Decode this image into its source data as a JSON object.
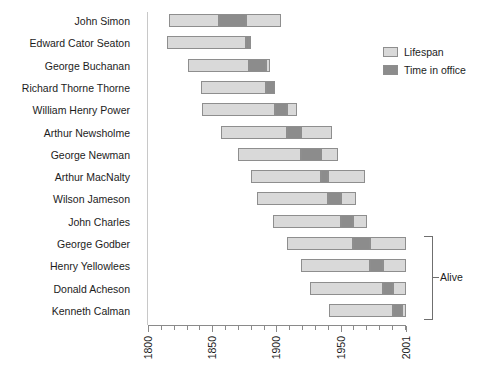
{
  "chart_data": {
    "type": "bar",
    "subtype": "horizontal-stacked-range",
    "title": "",
    "xlabel": "",
    "ylabel": "",
    "xlim": [
      1800,
      2001
    ],
    "grid": false,
    "legend_position": "top-right",
    "axis": {
      "tick_labels": [
        "1800",
        "1850",
        "1900",
        "1950",
        "2001"
      ],
      "tick_values": [
        1800,
        1850,
        1900,
        1950,
        2001
      ],
      "minor_tick_step": 10
    },
    "legend": [
      {
        "key": "lifespan",
        "label": "Lifespan",
        "color": "#d9d9d9"
      },
      {
        "key": "office",
        "label": "Time in office",
        "color": "#8c8c8c"
      }
    ],
    "annotations": [
      {
        "label": "Alive",
        "applies_to": [
          "George Godber",
          "Henry Yellowlees",
          "Donald Acheson",
          "Kenneth Calman"
        ]
      }
    ],
    "categories": [
      "John Simon",
      "Edward Cator Seaton",
      "George Buchanan",
      "Richard Thorne Thorne",
      "William Henry Power",
      "Arthur Newsholme",
      "George Newman",
      "Arthur MacNalty",
      "Wilson Jameson",
      "John Charles",
      "George Godber",
      "Henry Yellowlees",
      "Donald Acheson",
      "Kenneth Calman"
    ],
    "rows": [
      {
        "name": "John Simon",
        "born": 1816,
        "died": 1904,
        "office_start": 1855,
        "office_end": 1876,
        "alive": false
      },
      {
        "name": "Edward Cator Seaton",
        "born": 1815,
        "died": 1880,
        "office_start": 1876,
        "office_end": 1879,
        "alive": false
      },
      {
        "name": "George Buchanan",
        "born": 1831,
        "died": 1895,
        "office_start": 1879,
        "office_end": 1892,
        "alive": false
      },
      {
        "name": "Richard Thorne Thorne",
        "born": 1841,
        "died": 1899,
        "office_start": 1892,
        "office_end": 1899,
        "alive": false
      },
      {
        "name": "William Henry Power",
        "born": 1842,
        "died": 1916,
        "office_start": 1899,
        "office_end": 1908,
        "alive": false
      },
      {
        "name": "Arthur Newsholme",
        "born": 1857,
        "died": 1943,
        "office_start": 1908,
        "office_end": 1919,
        "alive": false
      },
      {
        "name": "George Newman",
        "born": 1870,
        "died": 1948,
        "office_start": 1919,
        "office_end": 1935,
        "alive": false
      },
      {
        "name": "Arthur MacNalty",
        "born": 1880,
        "died": 1969,
        "office_start": 1935,
        "office_end": 1940,
        "alive": false
      },
      {
        "name": "Wilson Jameson",
        "born": 1885,
        "died": 1962,
        "office_start": 1940,
        "office_end": 1950,
        "alive": false
      },
      {
        "name": "John Charles",
        "born": 1897,
        "died": 1971,
        "office_start": 1950,
        "office_end": 1960,
        "alive": false
      },
      {
        "name": "George Godber",
        "born": 1908,
        "died": 2001,
        "office_start": 1960,
        "office_end": 1973,
        "alive": true
      },
      {
        "name": "Henry Yellowlees",
        "born": 1919,
        "died": 2001,
        "office_start": 1973,
        "office_end": 1983,
        "alive": true
      },
      {
        "name": "Donald Acheson",
        "born": 1926,
        "died": 2001,
        "office_start": 1983,
        "office_end": 1991,
        "alive": true
      },
      {
        "name": "Kenneth Calman",
        "born": 1941,
        "died": 2001,
        "office_start": 1991,
        "office_end": 1998,
        "alive": true
      }
    ]
  },
  "caption": ""
}
